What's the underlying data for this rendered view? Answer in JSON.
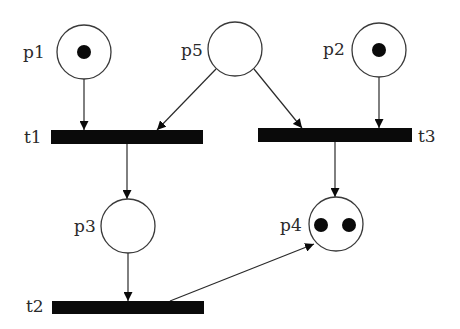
{
  "diagram": {
    "type": "petri-net",
    "places": [
      {
        "id": "p1",
        "label": "p1",
        "tokens": 1
      },
      {
        "id": "p2",
        "label": "p2",
        "tokens": 1
      },
      {
        "id": "p3",
        "label": "p3",
        "tokens": 0
      },
      {
        "id": "p4",
        "label": "p4",
        "tokens": 2
      },
      {
        "id": "p5",
        "label": "p5",
        "tokens": 0
      }
    ],
    "transitions": [
      {
        "id": "t1",
        "label": "t1"
      },
      {
        "id": "t2",
        "label": "t2"
      },
      {
        "id": "t3",
        "label": "t3"
      }
    ],
    "arcs": [
      {
        "from": "p1",
        "to": "t1"
      },
      {
        "from": "p5",
        "to": "t1"
      },
      {
        "from": "p5",
        "to": "t3"
      },
      {
        "from": "p2",
        "to": "t3"
      },
      {
        "from": "t1",
        "to": "p3"
      },
      {
        "from": "t3",
        "to": "p4"
      },
      {
        "from": "p3",
        "to": "t2"
      },
      {
        "from": "t2",
        "to": "p4"
      }
    ]
  },
  "labels": {
    "p1": "p1",
    "p2": "p2",
    "p3": "p3",
    "p4": "p4",
    "p5": "p5",
    "t1": "t1",
    "t2": "t2",
    "t3": "t3"
  }
}
